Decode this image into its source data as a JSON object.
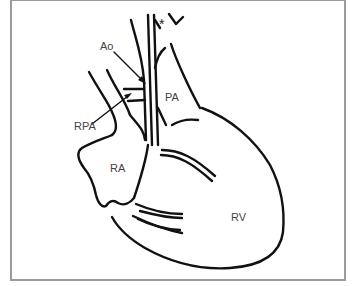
{
  "figure": {
    "type": "anatomical line drawing of the heart",
    "labels": {
      "ao": "Ao",
      "rpa": "RPA",
      "pa": "PA",
      "ra": "RA",
      "rv": "RV",
      "asterisk": "*"
    }
  }
}
